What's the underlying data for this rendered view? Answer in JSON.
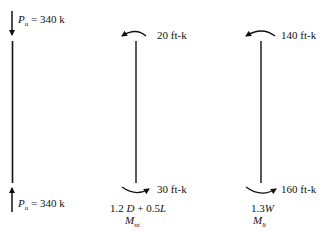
{
  "diagram": {
    "type": "column free-body diagrams",
    "axial_column": {
      "top_load": {
        "symbol": "P",
        "subscript": "u",
        "equals": "= 340 k",
        "direction": "down"
      },
      "bottom_load": {
        "symbol": "P",
        "subscript": "u",
        "equals": "= 340 k",
        "direction": "up"
      }
    },
    "nt_column": {
      "top_moment": "20 ft-k",
      "bottom_moment": "30 ft-k",
      "combination_parts": {
        "a": "1.2 ",
        "b": "D",
        "c": " + 0.5",
        "d": "L"
      },
      "moment_symbol": "M",
      "moment_subscript": "nt"
    },
    "lt_column": {
      "top_moment": "140 ft-k",
      "bottom_moment": "160 ft-k",
      "combination_parts": {
        "a": "1.3",
        "b": "W"
      },
      "moment_symbol": "M",
      "moment_subscript": "lt"
    },
    "colors": {
      "line": "#111111",
      "background": "#ffffff"
    }
  }
}
